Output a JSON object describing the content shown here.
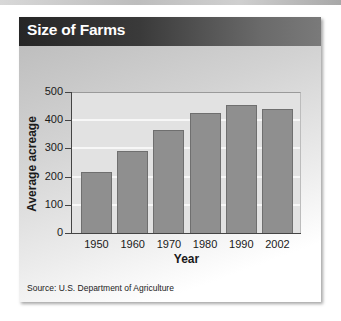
{
  "header": {
    "title": "Size of Farms"
  },
  "source": "Source: U.S. Department of Agriculture",
  "chart_data": {
    "type": "bar",
    "title": "Size of Farms",
    "xlabel": "Year",
    "ylabel": "Average acreage",
    "categories": [
      "1950",
      "1960",
      "1970",
      "1980",
      "1990",
      "2002"
    ],
    "values": [
      215,
      290,
      365,
      425,
      455,
      440
    ],
    "yticks": [
      "0",
      "100",
      "200",
      "300",
      "400",
      "500"
    ],
    "ylim": [
      0,
      500
    ],
    "grid": true,
    "legend": null,
    "colors": {
      "bar": "#8f8f8f",
      "plot_bg": "#e2e2e2",
      "gridline": "#f7f7f7",
      "header_bg": "#2e2e2e"
    },
    "source": "Source: U.S. Department of Agriculture"
  }
}
